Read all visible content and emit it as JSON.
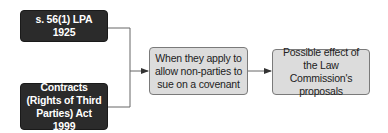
{
  "diagram": {
    "sources": [
      {
        "label": "s. 56(1) LPA 1925"
      },
      {
        "label": "Contracts (Rights of Third Parties) Act 1999"
      }
    ],
    "middle": {
      "label": "When they apply to allow non-parties to sue on a covenant"
    },
    "result": {
      "label": "Possible effect of the Law Commission's proposals"
    },
    "colors": {
      "dark_box": "#2b2b2b",
      "light_box": "#dcdcdc",
      "connector": "#555555"
    }
  }
}
